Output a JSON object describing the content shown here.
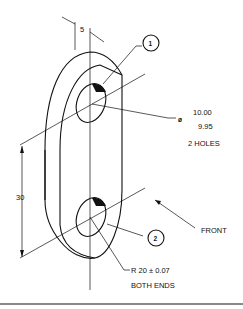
{
  "drawing": {
    "title": "Isometric link with two holes",
    "dimensions": {
      "thickness": "5",
      "center_distance": "30",
      "hole_symbol": "ø",
      "hole_dia_upper": "10.00",
      "hole_dia_lower": "9.95",
      "hole_count": "2 HOLES",
      "radius": "R 20 ± 0.07",
      "radius_note": "BOTH ENDS"
    },
    "callouts": [
      {
        "id": "1",
        "label": "1"
      },
      {
        "id": "2",
        "label": "2"
      }
    ],
    "view_label": "FRONT"
  },
  "colors": {
    "line": "#111111",
    "background": "#ffffff",
    "rule": "#8a8a8a"
  }
}
